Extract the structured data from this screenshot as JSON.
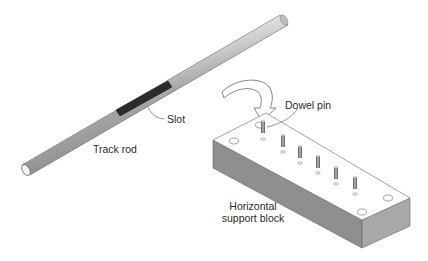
{
  "figure": {
    "colors": {
      "background": "#ffffff",
      "rod_body": "#9a9a9a",
      "rod_highlight": "#d8d8d8",
      "slot": "#2b2b2b",
      "block_top": "#ffffff",
      "block_side": "#8c8c8c",
      "block_front": "#a6a6a6",
      "outline": "#555555"
    }
  },
  "labels": {
    "slot": "Slot",
    "track_rod": "Track rod",
    "dowel_pin": "Dowel pin",
    "support_block_line1": "Horizontal",
    "support_block_line2": "support block"
  },
  "parts": {
    "track_rod": {
      "has_slot": true
    },
    "support_block": {
      "dowel_pin_count": 6,
      "mounting_hole_count": 4
    },
    "assembly_arrow": {
      "direction": "rod-to-block"
    }
  }
}
